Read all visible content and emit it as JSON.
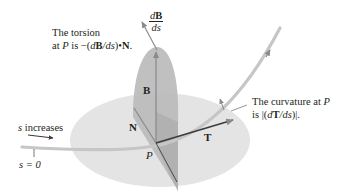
{
  "diagram": {
    "type": "Frenet frame illustration",
    "point_label": "P",
    "vectors": {
      "tangent": "T",
      "normal": "N",
      "binormal": "B",
      "binormal_derivative": {
        "numerator_d": "d",
        "numerator_vec": "B",
        "denominator": "ds"
      }
    },
    "annotations": {
      "torsion": {
        "line1": "The torsion",
        "line2_prefix": "at ",
        "line2_point": "P",
        "line2_is": " is −(",
        "line2_d": "d",
        "line2_B": "B",
        "line2_ds": "/ds",
        "line2_dot": ")•",
        "line2_N": "N",
        "line2_end": "."
      },
      "curvature": {
        "line1_prefix": "The curvature at ",
        "line1_point": "P",
        "line2_prefix": "is |(",
        "line2_d": "d",
        "line2_T": "T",
        "line2_ds": "/ds",
        "line2_end": ")|."
      },
      "s_increases": {
        "var": "s",
        "text": " increases"
      },
      "s_zero": "s = 0"
    },
    "colors": {
      "osculating_plane": "#e3e3e3",
      "normal_plane": "#b7b7b7",
      "curve": "#c8c8c8",
      "vector_line": "#3a3a3a",
      "text": "#231f20"
    }
  }
}
